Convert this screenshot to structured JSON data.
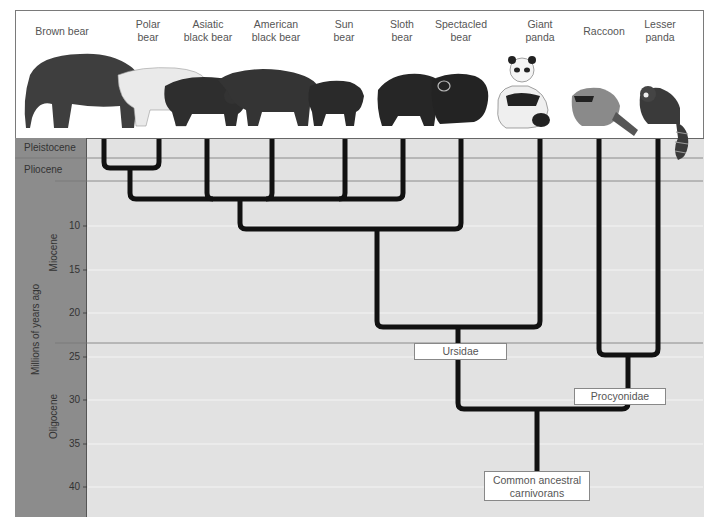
{
  "species": [
    {
      "name": "Brown bear",
      "line1": "Brown bear",
      "line2": "",
      "x": 62
    },
    {
      "name": "Polar bear",
      "line1": "Polar",
      "line2": "bear",
      "x": 148
    },
    {
      "name": "Asiatic black bear",
      "line1": "Asiatic",
      "line2": "black bear",
      "x": 208
    },
    {
      "name": "American black bear",
      "line1": "American",
      "line2": "black bear",
      "x": 276
    },
    {
      "name": "Sun bear",
      "line1": "Sun",
      "line2": "bear",
      "x": 344
    },
    {
      "name": "Sloth bear",
      "line1": "Sloth",
      "line2": "bear",
      "x": 402
    },
    {
      "name": "Spectacled bear",
      "line1": "Spectacled",
      "line2": "bear",
      "x": 461
    },
    {
      "name": "Giant panda",
      "line1": "Giant",
      "line2": "panda",
      "x": 540
    },
    {
      "name": "Raccoon",
      "line1": "Raccoon",
      "line2": "",
      "x": 604
    },
    {
      "name": "Lesser panda",
      "line1": "Lesser",
      "line2": "panda",
      "x": 660
    }
  ],
  "axis": {
    "title": "Millions of years ago",
    "ticks": [
      "10",
      "15",
      "20",
      "25",
      "30",
      "35",
      "40"
    ],
    "epochs": {
      "pleistocene": "Pleistocene",
      "pliocene": "Pliocene",
      "miocene": "Miocene",
      "oligocene": "Oligocene"
    }
  },
  "labels": {
    "ursidae": "Ursidae",
    "procyonidae": "Procyonidae",
    "common_ancestor_line1": "Common ancestral",
    "common_ancestor_line2": "carnivorans"
  },
  "tree": {
    "leaves": [
      {
        "species": "Brown bear",
        "x": 104
      },
      {
        "species": "Polar bear",
        "x": 159
      },
      {
        "species": "Asiatic black bear",
        "x": 207
      },
      {
        "species": "American black bear",
        "x": 272
      },
      {
        "species": "Sun bear",
        "x": 345
      },
      {
        "species": "Sloth bear",
        "x": 403
      },
      {
        "species": "Spectacled bear",
        "x": 461
      },
      {
        "species": "Giant panda",
        "x": 540
      },
      {
        "species": "Raccoon",
        "x": 599
      },
      {
        "species": "Lesser panda",
        "x": 658
      }
    ],
    "divergences_mya": [
      {
        "clade": "Brown bear + Polar bear",
        "mya": 3.5
      },
      {
        "clade": "Ursine bears (Asiatic, American, Sun, Sloth)",
        "mya": 7
      },
      {
        "clade": "+ Spectacled bear",
        "mya": 10
      },
      {
        "clade": "+ Giant panda (Ursidae)",
        "mya": 21.5
      },
      {
        "clade": "Raccoon + Lesser panda (Procyonidae)",
        "mya": 28
      },
      {
        "clade": "Ursidae + Procyonidae",
        "mya": 31
      },
      {
        "clade": "Common ancestral carnivorans",
        "mya": 38
      }
    ]
  },
  "colors": {
    "axis_panel": "#8c8c8c",
    "plot_bg": "#e2e2e2",
    "branch": "#111111",
    "gridline": "#f4f4f4"
  }
}
